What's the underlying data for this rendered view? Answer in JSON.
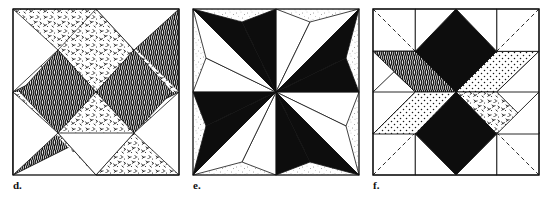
{
  "figure": {
    "kind": "quilt-block-illustrations",
    "background_color": "#ffffff",
    "ink_color": "#111111",
    "panel_count": 3,
    "panels": [
      {
        "id": "d",
        "label": "d.",
        "title": "Crossed diagonal bands block",
        "frame": {
          "x": 13,
          "y": 9,
          "size": 166
        },
        "description": "Two wide diagonal bands crossing in an X; one band wavy-hatched dark, the other stippled light, on a white ground.",
        "regions": [
          {
            "name": "band-bottomleft-to-topright",
            "fill": "wavy-hatch-dark"
          },
          {
            "name": "band-topleft-to-bottomright",
            "fill": "stipple-light"
          },
          {
            "name": "center-left-triangle",
            "fill": "wavy-hatch-dark"
          },
          {
            "name": "center-right-triangle",
            "fill": "wavy-hatch-dark"
          },
          {
            "name": "center-top-triangle",
            "fill": "stipple-light"
          },
          {
            "name": "center-bottom-triangle",
            "fill": "stipple-light"
          },
          {
            "name": "corner-top-white",
            "fill": "white"
          },
          {
            "name": "corner-bottom-white",
            "fill": "white"
          },
          {
            "name": "corner-left-white",
            "fill": "white"
          },
          {
            "name": "corner-right-white",
            "fill": "white"
          }
        ]
      },
      {
        "id": "e",
        "label": "e.",
        "title": "Eight-pointed star block",
        "frame": {
          "x": 193,
          "y": 9,
          "size": 166
        },
        "description": "Eight-pointed LeMoyne-style star of alternating solid black and white elongated points, radiating to the block edges and corners over a lightly speckled ground.",
        "regions": [
          {
            "name": "star-point-n",
            "fill": "black"
          },
          {
            "name": "star-point-ne",
            "fill": "black"
          },
          {
            "name": "star-point-e",
            "fill": "black"
          },
          {
            "name": "star-point-se",
            "fill": "black"
          },
          {
            "name": "star-point-s",
            "fill": "black"
          },
          {
            "name": "star-point-sw",
            "fill": "black"
          },
          {
            "name": "star-point-w",
            "fill": "black"
          },
          {
            "name": "star-point-nw",
            "fill": "black"
          },
          {
            "name": "background",
            "fill": "speckle-light"
          }
        ]
      },
      {
        "id": "f",
        "label": "f.",
        "title": "Eight-diamond star block with construction lines",
        "frame": {
          "x": 373,
          "y": 9,
          "size": 166
        },
        "description": "Eight diamonds radiating from the centre in alternating dark, dotted and hatched fabrics, with four plain corner squares carrying dashed diagonal construction lines and four plain edge triangles.",
        "regions": [
          {
            "name": "diamond-n",
            "fill": "black"
          },
          {
            "name": "diamond-ne",
            "fill": "dot-grid"
          },
          {
            "name": "diamond-e",
            "fill": "stipple-light"
          },
          {
            "name": "diamond-se",
            "fill": "black"
          },
          {
            "name": "diamond-s",
            "fill": "dot-grid"
          },
          {
            "name": "diamond-sw",
            "fill": "wavy-hatch-dark"
          },
          {
            "name": "diamond-w",
            "fill": "speckle-dense"
          },
          {
            "name": "diamond-nw",
            "fill": "wavy-hatch-dark"
          },
          {
            "name": "corner-square-nw",
            "fill": "white",
            "construction_line": "dashed"
          },
          {
            "name": "corner-square-ne",
            "fill": "white",
            "construction_line": "dashed"
          },
          {
            "name": "corner-square-sw",
            "fill": "white",
            "construction_line": "dashed"
          },
          {
            "name": "corner-square-se",
            "fill": "white",
            "construction_line": "dashed"
          },
          {
            "name": "edge-triangle-n",
            "fill": "white"
          },
          {
            "name": "edge-triangle-e",
            "fill": "white"
          },
          {
            "name": "edge-triangle-s",
            "fill": "white"
          },
          {
            "name": "edge-triangle-w",
            "fill": "white"
          }
        ]
      }
    ]
  }
}
